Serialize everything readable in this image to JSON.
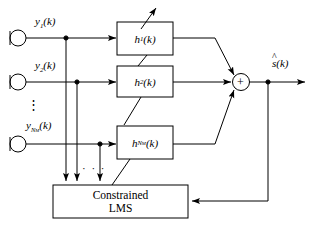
{
  "diagram": {
    "stroke_color": "#000000",
    "fill_color": "#ffffff",
    "inputs": [
      {
        "id": "mic1",
        "icon": "microphone-icon",
        "signal_main": "y",
        "signal_sub": "1",
        "signal_arg": "(k)",
        "label": "y1(k)"
      },
      {
        "id": "mic2",
        "icon": "microphone-icon",
        "signal_main": "y",
        "signal_sub": "2",
        "signal_arg": "(k)",
        "label": "y2(k)"
      },
      {
        "id": "micN",
        "icon": "microphone-icon",
        "signal_main": "y",
        "signal_sub": "NM",
        "signal_arg": "(k)",
        "label": "yNM(k)"
      }
    ],
    "filters": [
      {
        "id": "h1",
        "main": "h",
        "sub": "1",
        "arg": "(k)",
        "label": "h1(k)"
      },
      {
        "id": "h2",
        "main": "h",
        "sub": "2",
        "arg": "(k)",
        "label": "h2(k)"
      },
      {
        "id": "hN",
        "main": "h",
        "sub": "NM",
        "arg": "(k)",
        "label": "hNM(k)"
      }
    ],
    "summation": {
      "symbol": "+",
      "name": "summation-node"
    },
    "output": {
      "main": "s",
      "arg": "(k)",
      "accent": "^",
      "label": "s-hat(k)"
    },
    "adaptive_block": {
      "line1": "Constrained",
      "line2": "LMS"
    },
    "ellipsis_vertical": "⋮",
    "ellipsis_horizontal": "· · ·"
  }
}
